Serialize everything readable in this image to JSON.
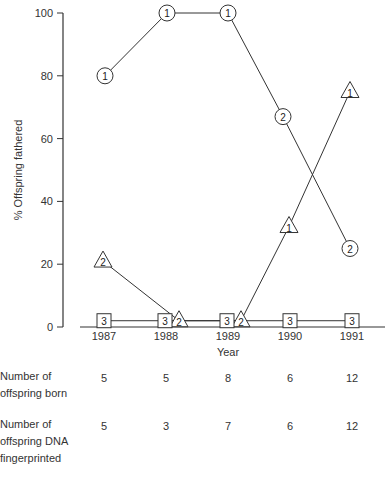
{
  "chart_data": {
    "type": "line",
    "title": "",
    "xlabel": "Year",
    "ylabel": "% Offspring fathered",
    "ylim": [
      0,
      100
    ],
    "yticks": [
      0,
      20,
      40,
      60,
      80,
      100
    ],
    "categories": [
      "1987",
      "1988",
      "1989",
      "1990",
      "1991"
    ],
    "grid": false,
    "legend": "none (markers labelled 1, 2, 3 by male rank)",
    "series": [
      {
        "name": "Male 1 (circle)",
        "marker": "circle",
        "values": [
          80,
          100,
          100,
          null,
          null
        ],
        "labels": [
          "1",
          "1",
          "1",
          null,
          null
        ]
      },
      {
        "name": "Male 2 (circle)",
        "marker": "circle",
        "values": [
          null,
          null,
          100,
          67,
          25
        ],
        "labels": [
          null,
          null,
          null,
          "2",
          "2"
        ]
      },
      {
        "name": "Male 2 (triangle)",
        "marker": "triangle",
        "values": [
          21,
          2,
          2,
          null,
          null
        ],
        "labels": [
          "2",
          "2",
          "2",
          null,
          null
        ]
      },
      {
        "name": "Male 1 (triangle)",
        "marker": "triangle",
        "values": [
          null,
          null,
          2,
          32,
          75
        ],
        "labels": [
          null,
          null,
          null,
          "1",
          "1"
        ]
      },
      {
        "name": "Male 3 (square)",
        "marker": "square",
        "values": [
          2,
          2,
          2,
          2,
          2
        ],
        "labels": [
          "3",
          "3",
          "3",
          "3",
          "3"
        ]
      }
    ]
  },
  "table": {
    "rows": [
      {
        "label": "Number of\noffspring born",
        "values": [
          "5",
          "5",
          "8",
          "6",
          "12"
        ]
      },
      {
        "label": "Number of\noffspring DNA\nfingerprinted",
        "values": [
          "5",
          "3",
          "7",
          "6",
          "12"
        ]
      }
    ]
  },
  "colors": {
    "line": "#333333",
    "text": "#333333",
    "background": "#ffffff"
  }
}
